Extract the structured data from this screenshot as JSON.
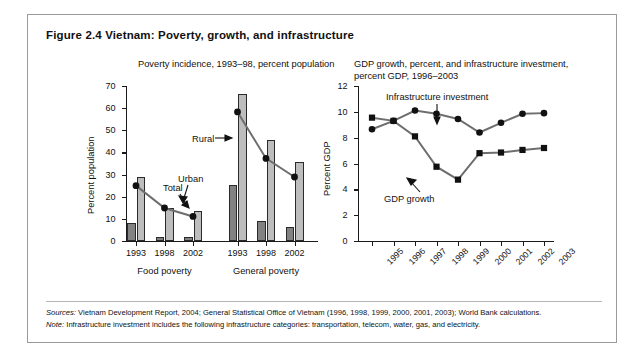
{
  "figure": {
    "title": "Figure 2.4  Vietnam: Poverty, growth, and infrastructure"
  },
  "footer": {
    "sources_label": "Sources:",
    "sources_text": " Vietnam Development Report, 2004; General Statistical Office of Vietnam (1996, 1998, 1999, 2000, 2001, 2003); World Bank calculations.",
    "note_label": "Note:",
    "note_text": " Infrastructure investment includes the following infrastructure categories: transportation, telecom, water, gas, and electricity."
  },
  "colors": {
    "urban_bar": "#828282",
    "rural_bar": "#bdbdbd",
    "line": "#6e6e6e",
    "marker": "#111111",
    "axis": "#1a1a1a",
    "frame": "#9a9a9a"
  },
  "chart_data": [
    {
      "type": "bar",
      "id": "poverty-incidence",
      "title": "Poverty incidence, 1993–98, percent population",
      "xlabel": "",
      "ylabel": "Percent population",
      "ylim": [
        0,
        70
      ],
      "yticks": [
        0,
        10,
        20,
        30,
        40,
        50,
        60,
        70
      ],
      "grid": false,
      "legend_position": "inline-annotations",
      "categories": [
        "1993",
        "1998",
        "2002",
        "1993",
        "1998",
        "2002"
      ],
      "group_labels": [
        "Food poverty",
        "General poverty"
      ],
      "series": [
        {
          "name": "Urban",
          "type": "bar",
          "values": [
            8,
            2,
            2,
            25.2,
            9.2,
            6.5
          ]
        },
        {
          "name": "Rural",
          "type": "bar",
          "values": [
            29,
            14.8,
            13.6,
            66.4,
            45.8,
            35.7
          ]
        },
        {
          "name": "Total",
          "type": "line",
          "values": [
            25,
            14.9,
            11.1,
            58.3,
            37.3,
            28.9
          ]
        }
      ],
      "annotations": [
        "Rural",
        "Urban",
        "Total"
      ]
    },
    {
      "type": "line",
      "id": "gdp-growth-infrastructure",
      "title": "GDP growth, percent, and infrastructure investment, percent GDP, 1996–2003",
      "xlabel": "",
      "ylabel": "Percent GDP",
      "ylim": [
        0,
        12
      ],
      "yticks": [
        0,
        2,
        4,
        6,
        8,
        10,
        12
      ],
      "grid": false,
      "legend_position": "inline-annotations",
      "x": [
        "1995",
        "1996",
        "1997",
        "1998",
        "1999",
        "2000",
        "2001",
        "2002",
        "2003"
      ],
      "series": [
        {
          "name": "Infrastructure investment",
          "marker": "circle",
          "values": [
            8.65,
            9.3,
            10.1,
            9.85,
            9.45,
            8.4,
            9.15,
            9.85,
            9.9
          ]
        },
        {
          "name": "GDP growth",
          "marker": "square",
          "values": [
            9.55,
            9.3,
            8.1,
            5.75,
            4.75,
            6.8,
            6.85,
            7.05,
            7.2
          ]
        }
      ],
      "annotations": [
        "Infrastructure investment",
        "GDP growth"
      ]
    }
  ]
}
